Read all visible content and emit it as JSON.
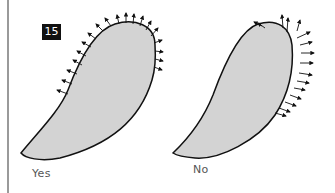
{
  "figure": {
    "number": "15",
    "panels": [
      {
        "caption": "Yes",
        "description": "Leaf-shaped blob with outward-pointing arrows along upper-left edge and rounded top"
      },
      {
        "caption": "No",
        "description": "Leaf-shaped blob with outward-pointing arrows along top and right edge"
      }
    ],
    "colors": {
      "fill": "#d3d3d3",
      "stroke": "#111111",
      "badge": "#111111"
    }
  }
}
